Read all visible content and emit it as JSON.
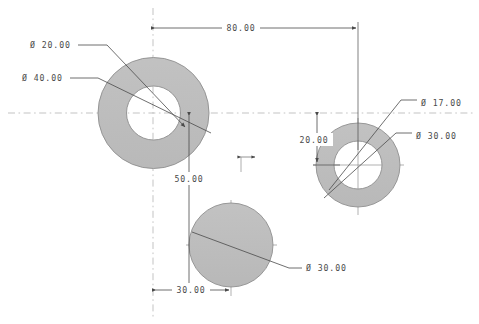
{
  "drawing": {
    "type": "mechanical-cad-dimensioned-sketch",
    "background_color": "#ffffff",
    "line_color": "#4a4a4a",
    "fill_color": "#bdbdbd",
    "centerline_color": "#b9b9b9",
    "diameter_symbol": "Ø",
    "features": [
      {
        "name": "left-annulus",
        "shape": "annulus",
        "center": [
          153.5,
          113
        ],
        "outer_diameter": 40.0,
        "inner_diameter": 20.0,
        "outer_radius_px": 55.5,
        "inner_radius_px": 27.0
      },
      {
        "name": "right-annulus",
        "shape": "annulus",
        "center": [
          358,
          165
        ],
        "outer_diameter": 30.0,
        "inner_diameter": 17.0,
        "outer_radius_px": 42.0,
        "inner_radius_px": 24.0
      },
      {
        "name": "bottom-circle",
        "shape": "circle",
        "center": [
          231,
          245
        ],
        "diameter": 30.0,
        "radius_px": 42.0
      }
    ],
    "labels": {
      "left_outer_diameter": "Ø 40.00",
      "left_inner_diameter": "Ø 20.00",
      "right_outer_diameter": "Ø 30.00",
      "right_inner_diameter": "Ø 17.00",
      "bottom_diameter": "Ø 30.00",
      "horizontal_span": "80.00",
      "vertical_offset_right": "20.00",
      "vertical_offset_bottom": "50.00",
      "horizontal_offset_bottom": "30.00"
    },
    "dimensions": [
      {
        "name": "horizontal-span-80",
        "value": "80.00",
        "orientation": "horizontal",
        "from_x": 153,
        "to_x": 358,
        "at_y": 28
      },
      {
        "name": "vertical-offset-50",
        "value": "50.00",
        "orientation": "vertical",
        "from_y": 113,
        "to_y": 290,
        "at_x": 189
      },
      {
        "name": "vertical-offset-20",
        "value": "20.00",
        "orientation": "vertical",
        "from_y": 113,
        "to_y": 165,
        "at_x": 317
      },
      {
        "name": "horizontal-offset-30",
        "value": "30.00",
        "orientation": "horizontal",
        "from_x": 153,
        "to_x": 231,
        "at_y": 290
      }
    ],
    "centerlines": [
      {
        "name": "horizontal-centerline",
        "orientation": "horizontal",
        "at": 113
      },
      {
        "name": "vertical-centerline",
        "orientation": "vertical",
        "at": 153
      }
    ]
  }
}
